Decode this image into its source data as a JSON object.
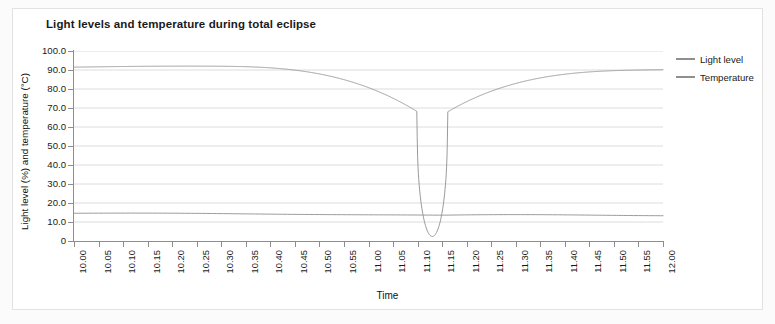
{
  "chart_data": {
    "type": "line",
    "title": "Light levels and temperature during total eclipse",
    "xlabel": "Time",
    "ylabel": "Light level (%) and temperature (°C)",
    "ylim": [
      0,
      100
    ],
    "ytick_labels": [
      "100.0",
      "90.0",
      "80.0",
      "70.0",
      "60.0",
      "50.0",
      "40.0",
      "30.0",
      "20.0",
      "10.0",
      "0"
    ],
    "ytick_values": [
      100,
      90,
      80,
      70,
      60,
      50,
      40,
      30,
      20,
      10,
      0
    ],
    "grid": true,
    "legend_position": "right",
    "categories": [
      "10.00",
      "10.05",
      "10.10",
      "10.15",
      "10.20",
      "10.25",
      "10.30",
      "10.35",
      "10.40",
      "10.45",
      "10.50",
      "10.55",
      "11.00",
      "11.05",
      "11.10",
      "11.15",
      "11.20",
      "11.25",
      "11.30",
      "11.35",
      "11.40",
      "11.45",
      "11.50",
      "11.55",
      "12.00"
    ],
    "x": [
      "10.00",
      "10.05",
      "10.10",
      "10.15",
      "10.20",
      "10.25",
      "10.30",
      "10.35",
      "10.40",
      "10.45",
      "10.50",
      "10.55",
      "11.00",
      "11.05",
      "11.10",
      "11.15",
      "11.20",
      "11.25",
      "11.30",
      "11.35",
      "11.40",
      "11.45",
      "11.50",
      "11.55",
      "12.00"
    ],
    "series": [
      {
        "name": "Light level",
        "color": "#8f8f8f",
        "values": [
          91.5,
          91.4,
          91.3,
          91.6,
          91.5,
          92.0,
          92.2,
          91.8,
          91.0,
          90.4,
          90.0,
          89.6,
          89.0,
          87.6,
          78.0,
          2.5,
          74.0,
          84.0,
          88.5,
          90.8,
          90.2,
          90.4,
          90.6,
          90.5,
          90.3
        ]
      },
      {
        "name": "Temperature",
        "color": "#8f8f8f",
        "values": [
          14.6,
          14.5,
          14.4,
          14.3,
          14.4,
          14.5,
          14.4,
          14.2,
          14.1,
          14.0,
          13.9,
          13.9,
          13.8,
          13.8,
          13.7,
          13.6,
          13.7,
          13.8,
          13.8,
          13.7,
          13.6,
          13.7,
          13.8,
          13.7,
          13.6
        ]
      }
    ],
    "annotations": {
      "totality_time": "11.13",
      "totality_minimum_light_percent": 2.5
    }
  },
  "legend": {
    "items": [
      {
        "label": "Light level",
        "color": "#8f8f8f"
      },
      {
        "label": "Temperature",
        "color": "#8f8f8f"
      }
    ]
  }
}
